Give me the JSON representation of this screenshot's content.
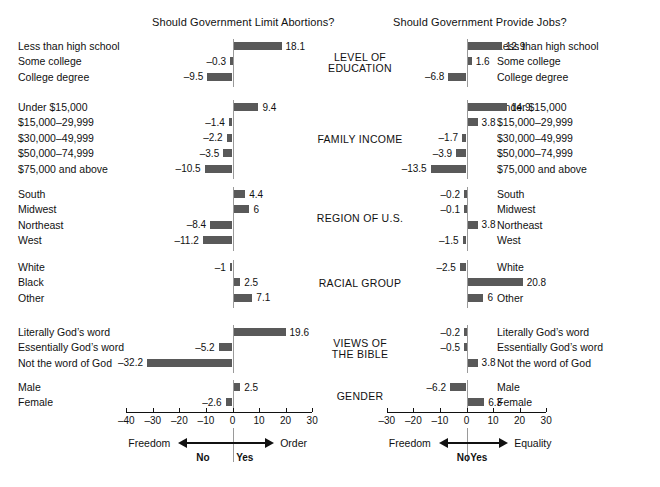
{
  "figure": {
    "bar_color": "#595959",
    "zero_line_color": "#9a9a9a",
    "axis_color": "#111111"
  },
  "chart_data": {
    "type": "bar",
    "title": "",
    "orientation": "horizontal",
    "grid": false,
    "panels": [
      {
        "id": "abortions",
        "title": "Should Government Limit Abortions?",
        "xlabel": "",
        "ylabel": "",
        "xlim": [
          -40,
          30
        ],
        "xticks": [
          -40,
          -30,
          -20,
          -10,
          0,
          10,
          20,
          30
        ],
        "xticklabels": [
          "–40",
          "–30",
          "–20",
          "–10",
          "0",
          "10",
          "20",
          "30"
        ],
        "anchor_negative": "Freedom",
        "anchor_positive": "Order",
        "anchor_negative_sub": "No",
        "anchor_positive_sub": "Yes",
        "groups": [
          {
            "name": "LEVEL OF EDUCATION",
            "name_lines": [
              "LEVEL OF",
              "EDUCATION"
            ],
            "categories": [
              "Less than high school",
              "Some college",
              "College degree"
            ],
            "values": [
              18.1,
              -0.3,
              -9.5
            ],
            "labels": [
              "18.1",
              "–0.3",
              "–9.5"
            ]
          },
          {
            "name": "FAMILY INCOME",
            "name_lines": [
              "FAMILY INCOME"
            ],
            "categories": [
              "Under $15,000",
              "$15,000–29,999",
              "$30,000–49,999",
              "$50,000–74,999",
              "$75,000 and above"
            ],
            "values": [
              9.4,
              -1.4,
              -2.2,
              -3.5,
              -10.5
            ],
            "labels": [
              "9.4",
              "–1.4",
              "–2.2",
              "–3.5",
              "–10.5"
            ]
          },
          {
            "name": "REGION OF U.S.",
            "name_lines": [
              "REGION OF U.S."
            ],
            "categories": [
              "South",
              "Midwest",
              "Northeast",
              "West"
            ],
            "values": [
              4.4,
              6,
              -8.4,
              -11.2
            ],
            "labels": [
              "4.4",
              "6",
              "–8.4",
              "–11.2"
            ]
          },
          {
            "name": "RACIAL GROUP",
            "name_lines": [
              "RACIAL GROUP"
            ],
            "categories": [
              "White",
              "Black",
              "Other"
            ],
            "values": [
              -1,
              2.5,
              7.1
            ],
            "labels": [
              "–1",
              "2.5",
              "7.1"
            ]
          },
          {
            "name": "VIEWS OF THE BIBLE",
            "name_lines": [
              "VIEWS OF",
              "THE BIBLE"
            ],
            "categories": [
              "Literally God’s word",
              "Essentially God’s word",
              "Not the word of God"
            ],
            "values": [
              19.6,
              -5.2,
              -32.2
            ],
            "labels": [
              "19.6",
              "–5.2",
              "–32.2"
            ]
          },
          {
            "name": "GENDER",
            "name_lines": [
              "GENDER"
            ],
            "categories": [
              "Male",
              "Female"
            ],
            "values": [
              2.5,
              -2.6
            ],
            "labels": [
              "2.5",
              "–2.6"
            ]
          }
        ]
      },
      {
        "id": "jobs",
        "title": "Should Government Provide Jobs?",
        "xlabel": "",
        "ylabel": "",
        "xlim": [
          -30,
          30
        ],
        "xticks": [
          -30,
          -20,
          -10,
          0,
          10,
          20,
          30
        ],
        "xticklabels": [
          "–30",
          "–20",
          "–10",
          "0",
          "10",
          "20",
          "30"
        ],
        "anchor_negative": "Freedom",
        "anchor_positive": "Equality",
        "anchor_negative_sub": "No",
        "anchor_positive_sub": "Yes",
        "groups": [
          {
            "name": "LEVEL OF EDUCATION",
            "name_lines": [
              "LEVEL OF",
              "EDUCATION"
            ],
            "categories": [
              "Less than high school",
              "Some college",
              "College degree"
            ],
            "values": [
              12.9,
              1.6,
              -6.8
            ],
            "labels": [
              "12.9",
              "1.6",
              "–6.8"
            ]
          },
          {
            "name": "FAMILY INCOME",
            "name_lines": [
              "FAMILY INCOME"
            ],
            "categories": [
              "Under $15,000",
              "$15,000–29,999",
              "$30,000–49,999",
              "$50,000–74,999",
              "$75,000 and above"
            ],
            "values": [
              14.9,
              3.8,
              -1.7,
              -3.9,
              -13.5
            ],
            "labels": [
              "14.9",
              "3.8",
              "–1.7",
              "–3.9",
              "–13.5"
            ]
          },
          {
            "name": "REGION OF U.S.",
            "name_lines": [
              "REGION OF U.S."
            ],
            "categories": [
              "South",
              "Midwest",
              "Northeast",
              "West"
            ],
            "values": [
              -0.2,
              -0.1,
              3.8,
              -1.5
            ],
            "labels": [
              "–0.2",
              "–0.1",
              "3.8",
              "–1.5"
            ]
          },
          {
            "name": "RACIAL GROUP",
            "name_lines": [
              "RACIAL GROUP"
            ],
            "categories": [
              "White",
              "Black",
              "Other"
            ],
            "values": [
              -2.5,
              20.8,
              6
            ],
            "labels": [
              "–2.5",
              "20.8",
              "6"
            ]
          },
          {
            "name": "VIEWS OF THE BIBLE",
            "name_lines": [
              "VIEWS OF",
              "THE BIBLE"
            ],
            "categories": [
              "Literally God’s word",
              "Essentially God’s word",
              "Not the word of God"
            ],
            "values": [
              -0.2,
              -0.5,
              3.8
            ],
            "labels": [
              "–0.2",
              "–0.5",
              "3.8"
            ]
          },
          {
            "name": "GENDER",
            "name_lines": [
              "GENDER"
            ],
            "categories": [
              "Male",
              "Female"
            ],
            "values": [
              -6.2,
              6.3
            ],
            "labels": [
              "–6.2",
              "6.3"
            ]
          }
        ]
      }
    ]
  }
}
